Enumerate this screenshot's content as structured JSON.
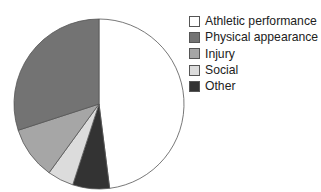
{
  "chart_data": {
    "type": "pie",
    "title": "",
    "start_angle_deg": 0,
    "direction": "clockwise",
    "categories": [
      "Athletic performance",
      "Physical appearance",
      "Injury",
      "Social",
      "Other"
    ],
    "values": [
      48,
      30,
      10,
      5,
      7
    ],
    "slice_order_clockwise_from_top": [
      "Athletic performance",
      "Other",
      "Social",
      "Injury",
      "Physical appearance"
    ],
    "colors": {
      "Athletic performance": "#ffffff",
      "Physical appearance": "#737373",
      "Injury": "#a6a6a6",
      "Social": "#dcdcdc",
      "Other": "#333333"
    },
    "legend_position": "right-top",
    "legend": [
      "Athletic performance",
      "Physical appearance",
      "Injury",
      "Social",
      "Other"
    ]
  },
  "legend": {
    "items": [
      {
        "label": "Athletic performance",
        "color": "#ffffff"
      },
      {
        "label": "Physical appearance",
        "color": "#737373"
      },
      {
        "label": "Injury",
        "color": "#a6a6a6"
      },
      {
        "label": "Social",
        "color": "#dcdcdc"
      },
      {
        "label": "Other",
        "color": "#333333"
      }
    ]
  }
}
